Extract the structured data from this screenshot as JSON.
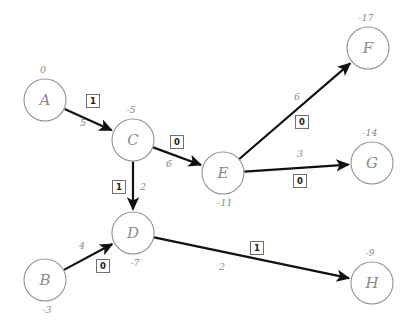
{
  "chart_data": {
    "type": "diagram",
    "title": "",
    "subtitle": "",
    "diagram_kind": "directed-weighted-graph",
    "nodes": [
      {
        "id": "A",
        "label": "A",
        "value": "0",
        "cx": 45,
        "cy": 100,
        "r": 21,
        "value_pos": "top"
      },
      {
        "id": "B",
        "label": "B",
        "value": "-3",
        "cx": 45,
        "cy": 280,
        "r": 21,
        "value_pos": "bottom"
      },
      {
        "id": "C",
        "label": "C",
        "value": "-5",
        "cx": 133,
        "cy": 140,
        "r": 21,
        "value_pos": "top"
      },
      {
        "id": "D",
        "label": "D",
        "value": "-7",
        "cx": 133,
        "cy": 233,
        "r": 21,
        "value_pos": "bottom"
      },
      {
        "id": "E",
        "label": "E",
        "value": "-11",
        "cx": 223,
        "cy": 173,
        "r": 21,
        "value_pos": "bottom"
      },
      {
        "id": "F",
        "label": "F",
        "value": "-17",
        "cx": 368,
        "cy": 48,
        "r": 21,
        "value_pos": "top"
      },
      {
        "id": "G",
        "label": "G",
        "value": "-14",
        "cx": 372,
        "cy": 163,
        "r": 21,
        "value_pos": "top"
      },
      {
        "id": "H",
        "label": "H",
        "value": "-9",
        "cx": 372,
        "cy": 283,
        "r": 21,
        "value_pos": "top"
      }
    ],
    "edges": [
      {
        "from": "A",
        "to": "C",
        "weight": "5",
        "box": "1",
        "weight_x": 83,
        "weight_y": 126,
        "box_x": 93,
        "box_y": 101
      },
      {
        "from": "C",
        "to": "E",
        "weight": "6",
        "box": "0",
        "weight_x": 169,
        "weight_y": 167,
        "box_x": 177,
        "box_y": 142
      },
      {
        "from": "C",
        "to": "D",
        "weight": "2",
        "box": "1",
        "weight_x": 143,
        "weight_y": 190,
        "box_x": 119,
        "box_y": 187
      },
      {
        "from": "B",
        "to": "D",
        "weight": "4",
        "box": "0",
        "weight_x": 82,
        "weight_y": 249,
        "box_x": 103,
        "box_y": 266
      },
      {
        "from": "E",
        "to": "F",
        "weight": "6",
        "box": "0",
        "weight_x": 297,
        "weight_y": 100,
        "box_x": 302,
        "box_y": 122
      },
      {
        "from": "E",
        "to": "G",
        "weight": "3",
        "box": "0",
        "weight_x": 300,
        "weight_y": 157,
        "box_x": 300,
        "box_y": 181
      },
      {
        "from": "D",
        "to": "H",
        "weight": "2",
        "box": "1",
        "weight_x": 222,
        "weight_y": 270,
        "box_x": 257,
        "box_y": 248
      }
    ],
    "legend": []
  }
}
